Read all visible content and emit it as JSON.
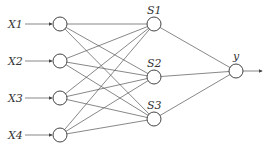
{
  "diagram": {
    "type": "neural-network",
    "inputs": [
      {
        "label": "X1",
        "x": 60,
        "y": 24
      },
      {
        "label": "X2",
        "x": 60,
        "y": 61
      },
      {
        "label": "X3",
        "x": 60,
        "y": 98
      },
      {
        "label": "X4",
        "x": 60,
        "y": 135
      }
    ],
    "hidden": [
      {
        "label": "S1",
        "x": 154,
        "y": 24
      },
      {
        "label": "S2",
        "x": 154,
        "y": 77
      },
      {
        "label": "S3",
        "x": 154,
        "y": 119
      }
    ],
    "output": {
      "label": "y",
      "x": 236,
      "y": 71
    },
    "node_radius": 7,
    "colors": {
      "stroke": "#444444",
      "edge": "#555555",
      "text": "#333333"
    }
  }
}
